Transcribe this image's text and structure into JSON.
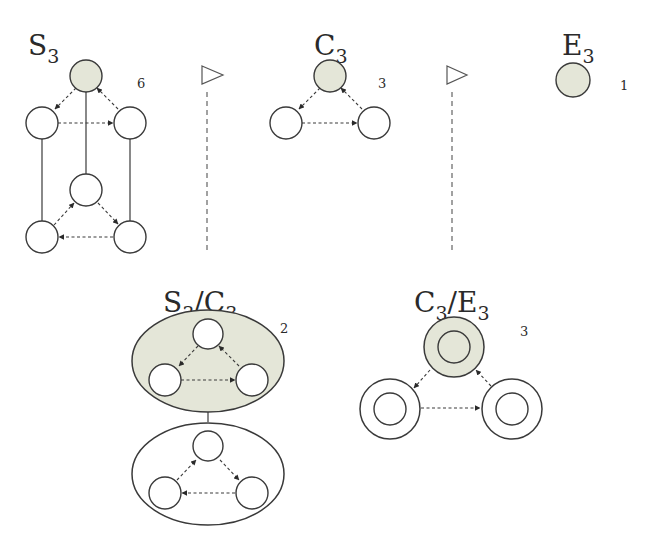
{
  "colors": {
    "highlight_fill": "#e4e6d8",
    "stroke": "#3a3a3a",
    "background": "#ffffff"
  },
  "groups": {
    "s3": {
      "label": "S",
      "subscript": "3",
      "count": "6"
    },
    "c3": {
      "label": "C",
      "subscript": "3",
      "count": "3"
    },
    "e3": {
      "label": "E",
      "subscript": "3",
      "count": "1"
    },
    "s3_c3": {
      "label_a": "S",
      "sub_a": "3",
      "slash": "/",
      "label_b": "C",
      "sub_b": "3",
      "count": "2"
    },
    "c3_e3": {
      "label_a": "C",
      "sub_a": "3",
      "slash": "/",
      "label_b": "E",
      "sub_b": "3",
      "count": "3"
    }
  },
  "separators": [
    {
      "symbol": "normal-subgroup-triangle",
      "between": [
        "S3",
        "C3"
      ]
    },
    {
      "symbol": "normal-subgroup-triangle",
      "between": [
        "C3",
        "E3"
      ]
    }
  ]
}
